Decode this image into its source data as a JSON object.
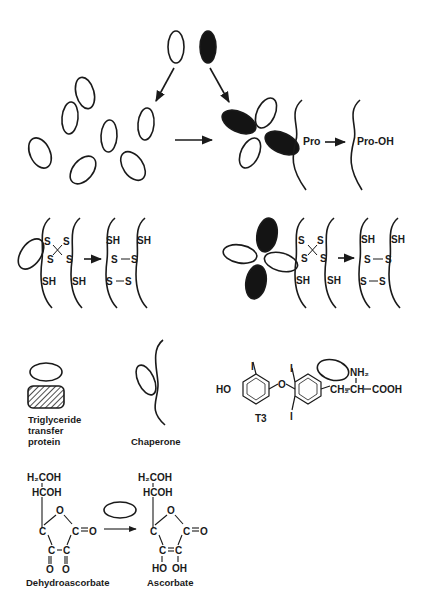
{
  "figure": {
    "top_panel": {
      "protein_chain_label_before": "Pro",
      "protein_chain_label_after": "Pro-OH"
    },
    "middle_panels": {
      "left": {
        "s_labels": [
          "S",
          "S",
          "S",
          "S"
        ],
        "sh_labels": [
          "SH",
          "SH"
        ],
        "product_sh_labels": [
          "SH",
          "SH"
        ],
        "product_bonds": [
          "S—S",
          "S—S"
        ]
      },
      "right": {
        "s_labels": [
          "S",
          "S",
          "S",
          "S"
        ],
        "sh_labels": [
          "SH",
          "SH"
        ],
        "product_sh_labels": [
          "SH",
          "SH"
        ],
        "product_bonds": [
          "S—S",
          "S—S"
        ]
      }
    },
    "legend_items": {
      "triglyceride_transfer_protein": {
        "label_line1": "Triglyceride",
        "label_line2": "transfer",
        "label_line3": "protein"
      },
      "chaperone": {
        "label": "Chaperone"
      },
      "t3": {
        "label": "T3",
        "groups": {
          "ho": "HO",
          "o": "O",
          "iodine": "I",
          "ch2": "CH₂",
          "ch": "CH",
          "nh2": "NH₂",
          "cooh": "COOH"
        }
      }
    },
    "reaction": {
      "reactant": {
        "label": "Dehydroascorbate",
        "groups": {
          "h2coh": "H₂COH",
          "hcoh": "HCOH",
          "ring_o": "O",
          "c": "C",
          "carbonyl_o": "O",
          "eq_o": "C═O"
        }
      },
      "product": {
        "label": "Ascorbate",
        "groups": {
          "h2coh": "H₂COH",
          "hcoh": "HCOH",
          "ring_o": "O",
          "c": "C",
          "eq_o": "C═O",
          "ho": "HO",
          "oh": "OH"
        }
      }
    },
    "colors": {
      "ink": "#1a1a1a",
      "fill_dark": "#141414",
      "background": "#ffffff"
    }
  }
}
